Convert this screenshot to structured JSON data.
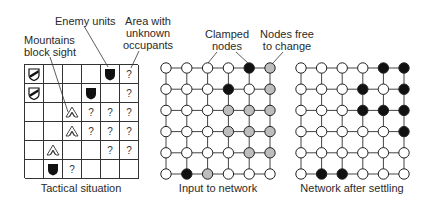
{
  "annotations": {
    "enemy_units": "Enemy units",
    "area_unknown": [
      "Area with",
      "unknown",
      "occupants"
    ],
    "mountains": [
      "Mountains",
      "block sight"
    ],
    "clamped": [
      "Clamped",
      "nodes"
    ],
    "free": [
      "Nodes free",
      "to change"
    ]
  },
  "captions": {
    "tactical": "Tactical situation",
    "input": "Input to network",
    "settled": "Network after settling"
  },
  "legend_icons": {
    "F": "friendly-unit-icon",
    "E": "enemy-unit-icon",
    "M": "mountain-icon",
    "?": "unknown-icon",
    "": "empty"
  },
  "tactical_grid": [
    [
      "F",
      "",
      "",
      "",
      "E",
      "?"
    ],
    [
      "F",
      "",
      "",
      "E",
      "",
      "?"
    ],
    [
      "",
      "",
      "M",
      "?",
      "?",
      "?"
    ],
    [
      "",
      "",
      "M",
      "?",
      "?",
      "?"
    ],
    [
      "",
      "M",
      "",
      "",
      "?",
      "?"
    ],
    [
      "",
      "E",
      "?",
      "",
      "",
      ""
    ]
  ],
  "node_colors": {
    "W": "#ffffff",
    "B": "#111111",
    "G": "#bdbdbd"
  },
  "input_network": [
    [
      "W",
      "W",
      "W",
      "W",
      "B",
      "G"
    ],
    [
      "W",
      "W",
      "W",
      "B",
      "W",
      "G"
    ],
    [
      "W",
      "W",
      "W",
      "G",
      "G",
      "G"
    ],
    [
      "W",
      "W",
      "W",
      "G",
      "G",
      "G"
    ],
    [
      "W",
      "W",
      "W",
      "W",
      "G",
      "G"
    ],
    [
      "W",
      "B",
      "G",
      "W",
      "W",
      "W"
    ]
  ],
  "settled_network": [
    [
      "W",
      "W",
      "W",
      "W",
      "B",
      "B"
    ],
    [
      "W",
      "W",
      "W",
      "B",
      "W",
      "B"
    ],
    [
      "W",
      "W",
      "W",
      "B",
      "B",
      "B"
    ],
    [
      "W",
      "W",
      "W",
      "W",
      "W",
      "B"
    ],
    [
      "W",
      "W",
      "W",
      "W",
      "W",
      "W"
    ],
    [
      "W",
      "B",
      "B",
      "W",
      "W",
      "W"
    ]
  ]
}
